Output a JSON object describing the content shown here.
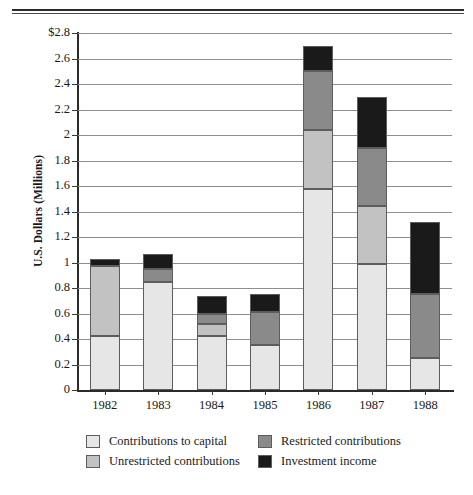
{
  "chart_data": {
    "type": "bar",
    "subtype": "stacked-bar",
    "title": "",
    "xlabel": "",
    "ylabel": "U.S. Dollars (Millions)",
    "ylim": [
      0,
      2.8
    ],
    "ytick_step": 0.2,
    "grid": true,
    "legend_position": "bottom",
    "categories": [
      "1982",
      "1983",
      "1984",
      "1985",
      "1986",
      "1987",
      "1988"
    ],
    "ytick_labels": [
      "$2.8",
      "2.6",
      "2.4",
      "2.2",
      "2",
      "1.8",
      "1.6",
      "1.4",
      "1.2",
      "1",
      "0.8",
      "0.6",
      "0.4",
      "0.2",
      "0"
    ],
    "ytick_values": [
      2.8,
      2.6,
      2.4,
      2.2,
      2.0,
      1.8,
      1.6,
      1.4,
      1.2,
      1.0,
      0.8,
      0.6,
      0.4,
      0.2,
      0
    ],
    "series": [
      {
        "name": "Contributions to capital",
        "color": "#e6e6e6",
        "values": [
          0.42,
          0.85,
          0.42,
          0.35,
          1.58,
          0.99,
          0.25
        ]
      },
      {
        "name": "Unrestricted contributions",
        "color": "#c2c2c2",
        "values": [
          0.55,
          0.0,
          0.1,
          0.0,
          0.46,
          0.45,
          0.0
        ]
      },
      {
        "name": "Restricted contributions",
        "color": "#8a8a8a",
        "values": [
          0.0,
          0.1,
          0.08,
          0.26,
          0.46,
          0.46,
          0.5
        ]
      },
      {
        "name": "Investment income",
        "color": "#1a1a1a",
        "values": [
          0.06,
          0.12,
          0.14,
          0.14,
          0.2,
          0.4,
          0.57
        ]
      }
    ],
    "totals": [
      1.03,
      1.07,
      0.74,
      0.75,
      2.7,
      2.3,
      1.32
    ]
  },
  "legend": {
    "entries": [
      {
        "label": "Contributions to capital",
        "color": "#e6e6e6"
      },
      {
        "label": "Restricted contributions",
        "color": "#8a8a8a"
      },
      {
        "label": "Unrestricted contributions",
        "color": "#c2c2c2"
      },
      {
        "label": "Investment income",
        "color": "#1a1a1a"
      }
    ]
  }
}
